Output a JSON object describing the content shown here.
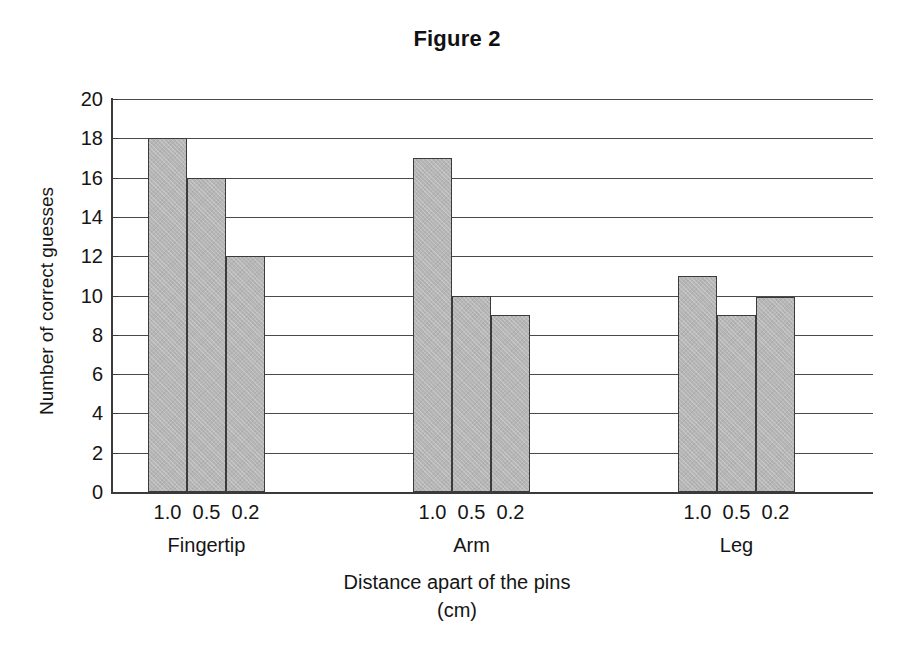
{
  "chart_data": {
    "type": "bar",
    "title": "Figure 2",
    "xlabel": "Distance apart of the pins",
    "xlabel_line2": "(cm)",
    "ylabel": "Number of correct guesses",
    "ylim": [
      0,
      20
    ],
    "ytick_step": 2,
    "yticks": [
      20,
      18,
      16,
      14,
      12,
      10,
      8,
      6,
      4,
      2,
      0
    ],
    "grid": "horizontal",
    "legend": "none",
    "bar_color": "#b6b6b6",
    "bar_border_color": "#3b3b3b",
    "categories": [
      "Fingertip",
      "Arm",
      "Leg"
    ],
    "subcategories": [
      "1.0",
      "0.5",
      "0.2"
    ],
    "groups": [
      {
        "label": "Fingertip",
        "bars": [
          {
            "tick": "1.0",
            "value": 18
          },
          {
            "tick": "0.5",
            "value": 16
          },
          {
            "tick": "0.2",
            "value": 12
          }
        ]
      },
      {
        "label": "Arm",
        "bars": [
          {
            "tick": "1.0",
            "value": 17
          },
          {
            "tick": "0.5",
            "value": 10
          },
          {
            "tick": "0.2",
            "value": 9
          }
        ]
      },
      {
        "label": "Leg",
        "bars": [
          {
            "tick": "1.0",
            "value": 11
          },
          {
            "tick": "0.5",
            "value": 9
          },
          {
            "tick": "0.2",
            "value": 9.9
          }
        ]
      }
    ]
  }
}
